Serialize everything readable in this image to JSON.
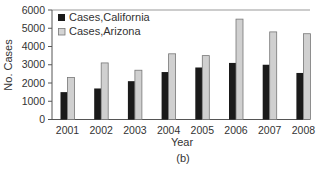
{
  "chart_data": {
    "type": "bar",
    "title": "",
    "caption": "(b)",
    "xlabel": "Year",
    "ylabel": "No. Cases",
    "ylim": [
      0,
      6000
    ],
    "yticks": [
      0,
      1000,
      2000,
      3000,
      4000,
      5000,
      6000
    ],
    "grid": false,
    "legend_position": "upper-left",
    "categories": [
      "2001",
      "2002",
      "2003",
      "2004",
      "2005",
      "2006",
      "2007",
      "2008"
    ],
    "series": [
      {
        "name": "Cases,California",
        "color": "#1a1a1a",
        "values": [
          1500,
          1700,
          2100,
          2600,
          2850,
          3100,
          3000,
          2550
        ]
      },
      {
        "name": "Cases,Arizona",
        "color": "#c8c8c8",
        "values": [
          2300,
          3100,
          2700,
          3600,
          3500,
          5500,
          4800,
          4700
        ]
      }
    ]
  },
  "labels": {
    "xlabel": "Year",
    "ylabel": "No. Cases",
    "caption": "(b)",
    "legend_0": "Cases,California",
    "legend_1": "Cases,Arizona"
  }
}
